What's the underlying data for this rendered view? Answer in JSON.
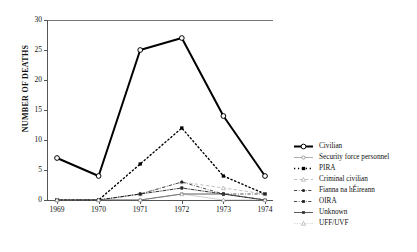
{
  "chart_data": {
    "type": "line",
    "title": "",
    "xlabel": "",
    "ylabel": "NUMBER OF DEATHS",
    "categories": [
      "1969",
      "1970",
      "1971",
      "1972",
      "1973",
      "1974"
    ],
    "x": [
      1969,
      1970,
      1971,
      1972,
      1973,
      1974
    ],
    "ylim": [
      0,
      30
    ],
    "yticks": [
      0,
      5,
      10,
      15,
      20,
      25,
      30
    ],
    "grid": false,
    "legend_position": "right",
    "series": [
      {
        "name": "Civilian",
        "values": [
          7,
          4,
          25,
          27,
          14,
          4
        ],
        "marker": "open-circle",
        "line": "solid",
        "width": 2.0,
        "color": "#000000"
      },
      {
        "name": "Security force personnel",
        "values": [
          0,
          0,
          1,
          2,
          1,
          0
        ],
        "marker": "open-circle",
        "line": "solid",
        "width": 0.6,
        "color": "#777777"
      },
      {
        "name": "PIRA",
        "values": [
          0,
          0,
          6,
          12,
          4,
          1
        ],
        "marker": "filled-square",
        "line": "dotted",
        "width": 1.4,
        "color": "#000000"
      },
      {
        "name": "Criminal civilian",
        "values": [
          0,
          0,
          1,
          3,
          2,
          1
        ],
        "marker": "open-triangle",
        "line": "dashed",
        "width": 0.6,
        "color": "#999999"
      },
      {
        "name": "Fianna na hÉireann",
        "values": [
          0,
          0,
          1,
          3,
          1,
          0
        ],
        "marker": "filled-circle",
        "line": "dash-dot",
        "width": 0.8,
        "color": "#222222"
      },
      {
        "name": "OIRA",
        "values": [
          0,
          0,
          1,
          2,
          1,
          1
        ],
        "marker": "filled-square",
        "line": "dash-dot",
        "width": 0.8,
        "color": "#222222"
      },
      {
        "name": "Unknown",
        "values": [
          0,
          0,
          0,
          1,
          1,
          0
        ],
        "marker": "filled-square",
        "line": "solid",
        "width": 0.8,
        "color": "#333333"
      },
      {
        "name": "UFF/UVF",
        "values": [
          0,
          0,
          0,
          1,
          0,
          0
        ],
        "marker": "open-triangle",
        "line": "dotted",
        "width": 0.6,
        "color": "#999999"
      }
    ]
  },
  "legend": {
    "items": [
      {
        "label": "Civilian"
      },
      {
        "label": "Security force personnel"
      },
      {
        "label": "PIRA"
      },
      {
        "label": "Criminal civilian"
      },
      {
        "label": "Fianna na hÉireann"
      },
      {
        "label": "OIRA"
      },
      {
        "label": "Unknown"
      },
      {
        "label": "UFF/UVF"
      }
    ]
  }
}
